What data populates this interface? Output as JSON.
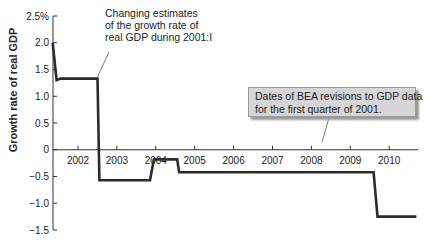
{
  "chart_data": {
    "type": "line",
    "title": "",
    "xlabel": "",
    "ylabel": "Growth rate of real GDP",
    "y_tick_labels": [
      "2.5%",
      "2.0",
      "1.5",
      "1.0",
      "0.5",
      "0",
      "-0.5",
      "-1.0",
      "-1.5"
    ],
    "y_ticks": [
      2.5,
      2.0,
      1.5,
      1.0,
      0.5,
      0,
      -0.5,
      -1.0,
      -1.5
    ],
    "x_tick_labels": [
      "2002",
      "2003",
      "2004",
      "2005",
      "2006",
      "2007",
      "2008",
      "2009",
      "2010"
    ],
    "ylim": [
      -1.5,
      2.5
    ],
    "xlim": [
      2001.35,
      2010.7
    ],
    "grid": false,
    "legend": null,
    "series": [
      {
        "name": "Estimated growth rate of real GDP for 2001:I",
        "style": "step",
        "x": [
          2001.35,
          2001.45,
          2001.55,
          2002.5,
          2002.55,
          2003.85,
          2003.95,
          2004.55,
          2004.6,
          2009.6,
          2009.7,
          2010.7
        ],
        "y": [
          2.0,
          1.3,
          1.33,
          1.33,
          -0.57,
          -0.57,
          -0.18,
          -0.18,
          -0.42,
          -0.42,
          -1.25,
          -1.25
        ]
      }
    ],
    "annotations": [
      {
        "text": "Changing estimates of the growth rate of real GDP during 2001:I",
        "points_to": [
          2002.45,
          1.33
        ]
      },
      {
        "text": "Dates of BEA revisions to GDP data for the first quarter of 2001.",
        "points_to": [
          2008.3,
          0
        ],
        "boxed": true
      }
    ]
  },
  "labels": {
    "ylabel": "Growth rate of real GDP",
    "annot1_line1": "Changing estimates",
    "annot1_line2": "of the growth rate of",
    "annot1_line3": "real GDP during 2001:I",
    "callout_line1": "Dates of BEA revisions to GDP data",
    "callout_line2": "for the first quarter of 2001."
  },
  "colors": {
    "line": "#2b2b2b",
    "axis": "#333333",
    "callout_bg": "#d6d6d6"
  }
}
